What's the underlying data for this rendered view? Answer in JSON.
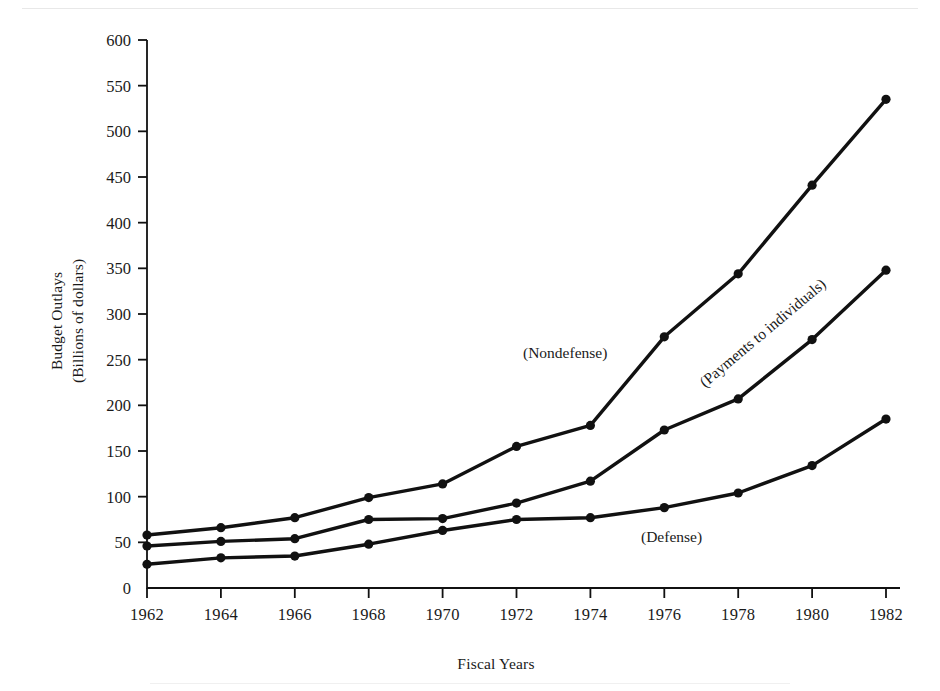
{
  "figure": {
    "y_axis_title_line1": "Budget Outlays",
    "y_axis_title_line2": "(Billions of dollars)",
    "x_axis_title": "Fiscal Years"
  },
  "annotations": {
    "nondefense": "(Nondefense)",
    "payments": "(Payments to individuals)",
    "defense": "(Defense)"
  },
  "colors": {
    "line": "#111111",
    "axis": "#111111",
    "background": "#ffffff",
    "text": "#1a1a1a"
  },
  "chart_data": {
    "type": "line",
    "title": "",
    "xlabel": "Fiscal Years",
    "ylabel": "Budget Outlays (Billions of dollars)",
    "categories": [
      1962,
      1964,
      1966,
      1968,
      1970,
      1972,
      1974,
      1976,
      1978,
      1980,
      1982
    ],
    "x": [
      1962,
      1964,
      1966,
      1968,
      1970,
      1972,
      1974,
      1976,
      1978,
      1980,
      1982
    ],
    "xlim": [
      1962,
      1982
    ],
    "ylim": [
      0,
      600
    ],
    "ytick_labels": [
      "0",
      "50",
      "100",
      "150",
      "200",
      "250",
      "300",
      "350",
      "400",
      "450",
      "500",
      "550",
      "600"
    ],
    "ytick_values": [
      0,
      50,
      100,
      150,
      200,
      250,
      300,
      350,
      400,
      450,
      500,
      550,
      600
    ],
    "xtick_labels": [
      "1962",
      "1964",
      "1966",
      "1968",
      "1970",
      "1972",
      "1974",
      "1976",
      "1978",
      "1980",
      "1982"
    ],
    "grid": false,
    "legend": "inline-annotations",
    "markers": "filled-circle",
    "series": [
      {
        "name": "(Nondefense)",
        "values": [
          58,
          66,
          77,
          99,
          114,
          155,
          178,
          275,
          344,
          441,
          535
        ]
      },
      {
        "name": "(Payments to individuals)",
        "values": [
          46,
          51,
          54,
          75,
          76,
          93,
          117,
          173,
          207,
          272,
          348
        ]
      },
      {
        "name": "(Defense)",
        "values": [
          26,
          33,
          35,
          48,
          63,
          75,
          77,
          88,
          104,
          134,
          185
        ]
      }
    ]
  }
}
